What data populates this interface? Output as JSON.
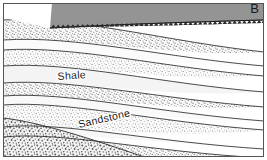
{
  "figure": {
    "panel_letter": "B",
    "width": 267,
    "height": 160,
    "frame_color": "#555555",
    "background_color": "#ffffff"
  },
  "labels": {
    "shale": "Shale",
    "sandstone": "Sandstone"
  },
  "colors": {
    "upper_unit_gray": "#949494",
    "bed_light": "#f2f2f2",
    "bed_white": "#fcfcfc",
    "stipple_dot": "#5a5a5a",
    "conglomerate_dot": "#4a4a4a",
    "contact_line": "#2b2b2b",
    "unconformity_line": "#1a1a1a"
  },
  "diagram": {
    "type": "geologic-cross-section",
    "structure": "angular-unconformity",
    "dip_direction": "right",
    "upper_unit": {
      "name": "upper-gray-unit",
      "fill": "solid-gray",
      "top_boundary": "panel-top",
      "base_boundary": "erosional-unconformity"
    },
    "unconformity": {
      "style": "sawtooth",
      "tooth_count": 44,
      "tooth_width": 4.6,
      "tooth_height": 3.2,
      "start_x": 50,
      "start_y": 28,
      "end_x": 262,
      "end_y": 20
    },
    "beds": [
      {
        "id": "bed-1",
        "pattern": "stipple",
        "label": null
      },
      {
        "id": "bed-2",
        "pattern": "plain-light",
        "label": null
      },
      {
        "id": "bed-3",
        "pattern": "stipple",
        "label": null
      },
      {
        "id": "bed-4",
        "pattern": "plain-light",
        "label": "Shale"
      },
      {
        "id": "bed-5",
        "pattern": "stipple",
        "label": null
      },
      {
        "id": "bed-6",
        "pattern": "plain-light",
        "label": null
      },
      {
        "id": "bed-7",
        "pattern": "stipple",
        "label": "Sandstone"
      },
      {
        "id": "bed-8",
        "pattern": "plain-light",
        "label": null
      },
      {
        "id": "bed-9",
        "pattern": "stipple",
        "label": null
      }
    ],
    "basal_unit": {
      "id": "conglomerate",
      "pattern": "coarse-stipple",
      "position": "bottom-left-wedge"
    },
    "shale_label": {
      "x": 72,
      "y": 79,
      "rotation": -4
    },
    "sandstone_label": {
      "x": 105,
      "y": 122,
      "rotation": -13
    }
  }
}
